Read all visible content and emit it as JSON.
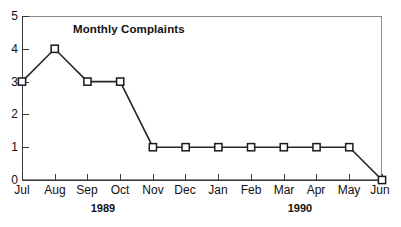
{
  "chart_data": {
    "type": "line",
    "title": "Monthly Complaints",
    "xlabel": "",
    "ylabel": "",
    "categories": [
      "Jul",
      "Aug",
      "Sep",
      "Oct",
      "Nov",
      "Dec",
      "Jan",
      "Feb",
      "Mar",
      "Apr",
      "May",
      "Jun"
    ],
    "values": [
      3,
      4,
      3,
      3,
      1,
      1,
      1,
      1,
      1,
      1,
      1,
      0
    ],
    "series": [
      {
        "name": "Monthly Complaints",
        "values": [
          3,
          4,
          3,
          3,
          1,
          1,
          1,
          1,
          1,
          1,
          1,
          0
        ]
      }
    ],
    "ylim": [
      0,
      5
    ],
    "y_ticks": [
      "0",
      "1",
      "2",
      "3",
      "4",
      "5"
    ],
    "grid": false,
    "legend": false,
    "marker": "open-square",
    "line_color": "#262626",
    "marker_fill": "#ffffff",
    "marker_edge": "#1a1a1a",
    "axis_color": "#3a3a3a",
    "frame_color": "#8b8b8b",
    "group_labels": [
      {
        "label": "1989",
        "span": [
          "Jul",
          "Oct"
        ]
      },
      {
        "label": "1990",
        "span": [
          "Jan",
          "Apr"
        ]
      }
    ],
    "annotations": []
  },
  "axes": {
    "y_ticks": [
      {
        "value": "5"
      },
      {
        "value": "4"
      },
      {
        "value": "3"
      },
      {
        "value": "2"
      },
      {
        "value": "1"
      },
      {
        "value": "0"
      }
    ],
    "x_ticks": [
      {
        "label": "Jul"
      },
      {
        "label": "Aug"
      },
      {
        "label": "Sep"
      },
      {
        "label": "Oct"
      },
      {
        "label": "Nov"
      },
      {
        "label": "Dec"
      },
      {
        "label": "Jan"
      },
      {
        "label": "Feb"
      },
      {
        "label": "Mar"
      },
      {
        "label": "Apr"
      },
      {
        "label": "May"
      },
      {
        "label": "Jun"
      }
    ],
    "year_groups": [
      {
        "label": "1989"
      },
      {
        "label": "1990"
      }
    ]
  }
}
